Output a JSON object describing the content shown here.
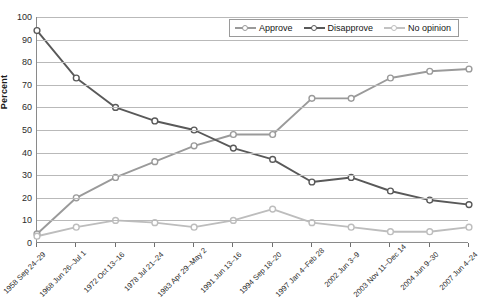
{
  "chart_data": {
    "type": "line",
    "title": "",
    "xlabel": "",
    "ylabel": "Percent",
    "ylim": [
      0,
      100
    ],
    "ytick_step": 10,
    "grid": true,
    "legend_position": "top-right",
    "yticks": [
      "100",
      "90",
      "80",
      "70",
      "60",
      "50",
      "40",
      "30",
      "20",
      "10",
      "0"
    ],
    "categories": [
      "1958 Sep 24–29",
      "1968 Jun 26–Jul 1",
      "1972 Oct 13–16",
      "1978 Jul 21–24",
      "1983 Apr 29–May 2",
      "1991 Jun 13–16",
      "1994 Sep 18–20",
      "1997 Jan 4–Feb 28",
      "2002 Jun 3–9",
      "2003 Nov 11–Dec 14",
      "2004 Jun 9–30",
      "2007 Jun 4–24"
    ],
    "series": [
      {
        "name": "Approve",
        "color": "#9a9a9a",
        "values": [
          4,
          20,
          29,
          36,
          43,
          48,
          48,
          64,
          64,
          73,
          76,
          77
        ]
      },
      {
        "name": "Disapprove",
        "color": "#595959",
        "values": [
          94,
          73,
          60,
          54,
          50,
          42,
          37,
          27,
          29,
          23,
          19,
          17
        ]
      },
      {
        "name": "No opinion",
        "color": "#bdbdbd",
        "values": [
          3,
          7,
          10,
          9,
          7,
          10,
          15,
          9,
          7,
          5,
          5,
          7
        ]
      }
    ]
  },
  "legend": {
    "items": [
      {
        "label": "Approve"
      },
      {
        "label": "Disapprove"
      },
      {
        "label": "No opinion"
      }
    ]
  }
}
